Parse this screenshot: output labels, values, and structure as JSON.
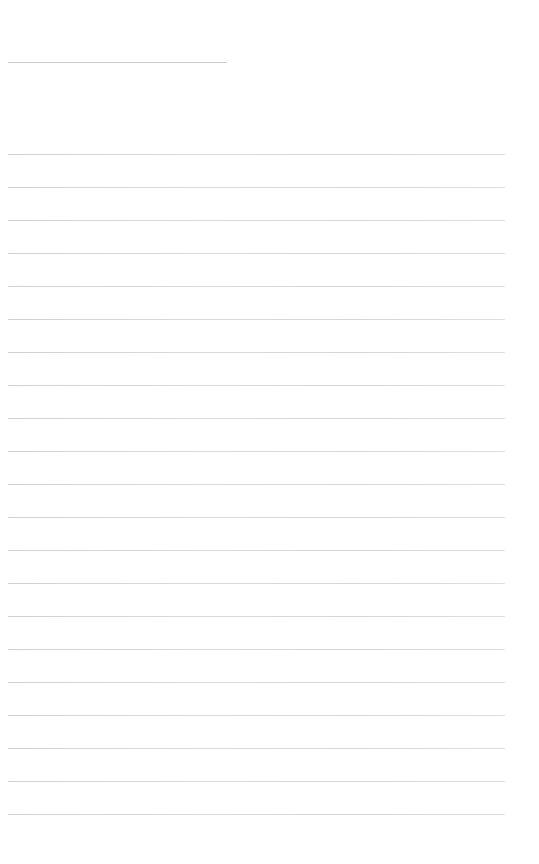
{
  "page": {
    "background": "#ffffff",
    "ink_color": "#cccccc",
    "note": "Text is rendered at sub-pixel size and is illegible; line geometry only."
  },
  "title": {
    "text": "",
    "top": 62,
    "width": 219
  },
  "lines": [
    {
      "top": 154,
      "width": 497,
      "text": ""
    },
    {
      "top": 187,
      "width": 497,
      "text": ""
    },
    {
      "top": 220,
      "width": 497,
      "text": ""
    },
    {
      "top": 253,
      "width": 497,
      "text": ""
    },
    {
      "top": 286,
      "width": 497,
      "text": ""
    },
    {
      "top": 319,
      "width": 497,
      "text": ""
    },
    {
      "top": 352,
      "width": 497,
      "text": ""
    },
    {
      "top": 385,
      "width": 497,
      "text": ""
    },
    {
      "top": 418,
      "width": 497,
      "text": ""
    },
    {
      "top": 451,
      "width": 497,
      "text": ""
    },
    {
      "top": 484,
      "width": 497,
      "text": ""
    },
    {
      "top": 517,
      "width": 497,
      "text": ""
    },
    {
      "top": 550,
      "width": 497,
      "text": ""
    },
    {
      "top": 583,
      "width": 497,
      "text": ""
    },
    {
      "top": 616,
      "width": 497,
      "text": ""
    },
    {
      "top": 649,
      "width": 497,
      "text": ""
    },
    {
      "top": 682,
      "width": 497,
      "text": ""
    },
    {
      "top": 715,
      "width": 497,
      "text": ""
    },
    {
      "top": 748,
      "width": 497,
      "text": ""
    },
    {
      "top": 781,
      "width": 497,
      "text": ""
    },
    {
      "top": 814,
      "width": 497,
      "text": ""
    }
  ]
}
